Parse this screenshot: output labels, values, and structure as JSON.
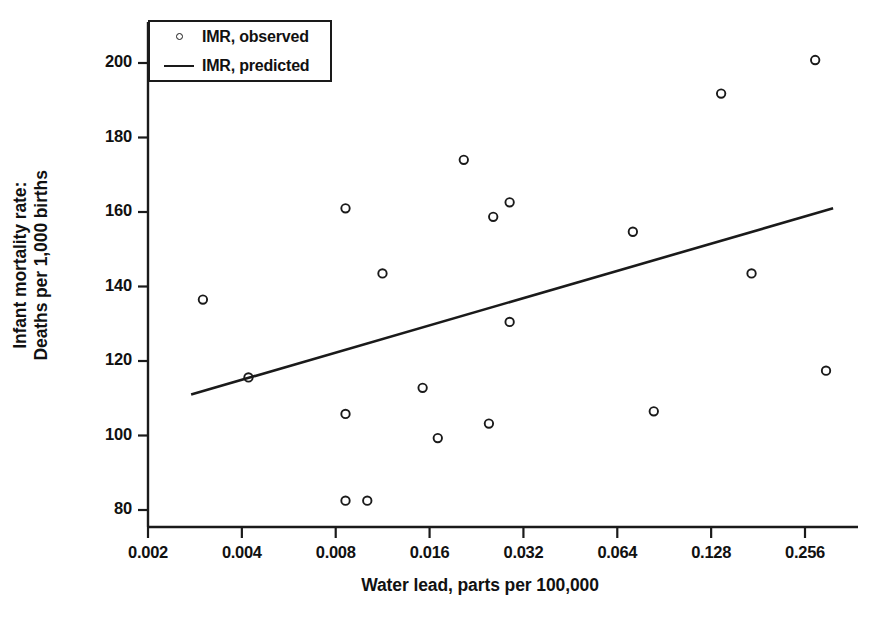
{
  "chart_data": {
    "type": "scatter",
    "title": "",
    "xlabel": "Water lead, parts per 100,000",
    "ylabel_line1": "Infant mortality rate:",
    "ylabel_line2": "Deaths per 1,000 births",
    "x_scale": "log2",
    "x_ticks": [
      0.002,
      0.004,
      0.008,
      0.016,
      0.032,
      0.064,
      0.128,
      0.256
    ],
    "x_tick_labels": [
      "0.002",
      "0.004",
      "0.008",
      "0.016",
      "0.032",
      "0.064",
      "0.128",
      "0.256"
    ],
    "y_ticks": [
      80,
      100,
      120,
      140,
      160,
      180,
      200
    ],
    "y_tick_labels": [
      "80",
      "100",
      "120",
      "140",
      "160",
      "180",
      "200"
    ],
    "xlim": [
      0.0017,
      0.345
    ],
    "ylim": [
      75,
      208
    ],
    "grid": false,
    "legend_position": "top-left",
    "series": [
      {
        "name": "IMR, observed",
        "type": "scatter",
        "marker": "open-circle",
        "color": "#1a1a1a",
        "points": [
          {
            "x": 0.003,
            "y": 136.5
          },
          {
            "x": 0.0042,
            "y": 115.6
          },
          {
            "x": 0.0086,
            "y": 161.0
          },
          {
            "x": 0.0086,
            "y": 105.8
          },
          {
            "x": 0.0086,
            "y": 82.5
          },
          {
            "x": 0.0101,
            "y": 82.5
          },
          {
            "x": 0.0113,
            "y": 143.5
          },
          {
            "x": 0.0152,
            "y": 112.8
          },
          {
            "x": 0.017,
            "y": 99.3
          },
          {
            "x": 0.0206,
            "y": 174.0
          },
          {
            "x": 0.0256,
            "y": 158.7
          },
          {
            "x": 0.0248,
            "y": 103.2
          },
          {
            "x": 0.0289,
            "y": 162.6
          },
          {
            "x": 0.0289,
            "y": 130.5
          },
          {
            "x": 0.0718,
            "y": 154.7
          },
          {
            "x": 0.0838,
            "y": 106.5
          },
          {
            "x": 0.1378,
            "y": 191.8
          },
          {
            "x": 0.1725,
            "y": 143.5
          },
          {
            "x": 0.276,
            "y": 200.8
          },
          {
            "x": 0.299,
            "y": 117.4
          }
        ]
      },
      {
        "name": "IMR, predicted",
        "type": "line",
        "color": "#1a1a1a",
        "endpoints": [
          {
            "x": 0.00275,
            "y": 111.0
          },
          {
            "x": 0.315,
            "y": 161.0
          }
        ]
      }
    ]
  },
  "legend": {
    "items": [
      {
        "label": "IMR, observed",
        "key": "open-circle-marker"
      },
      {
        "label": "IMR, predicted",
        "key": "solid-line-marker"
      }
    ]
  },
  "colors": {
    "axis": "#1a1a1a",
    "marker": "#1a1a1a",
    "line": "#1a1a1a",
    "background": "#ffffff"
  }
}
